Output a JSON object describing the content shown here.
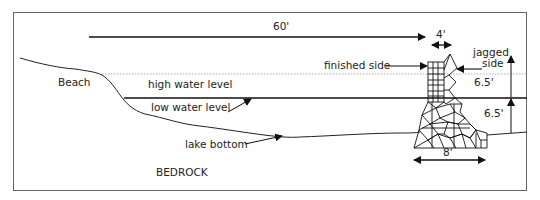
{
  "diagram": {
    "colors": {
      "stroke": "#222222",
      "border": "#666666",
      "background": "#ffffff",
      "dotted": "#999999"
    },
    "labels": {
      "beach": "Beach",
      "high_water": "high water level",
      "low_water": "low water level",
      "lake_bottom": "lake bottom",
      "bedrock": "BEDROCK",
      "finished_side": "finished side",
      "jagged_side_line1": "jagged",
      "jagged_side_line2": "side"
    },
    "dimensions": {
      "distance_from_shore": "60'",
      "top_width": "4'",
      "base_width": "8'",
      "upper_height": "6.5'",
      "lower_height": "6.5'"
    }
  }
}
